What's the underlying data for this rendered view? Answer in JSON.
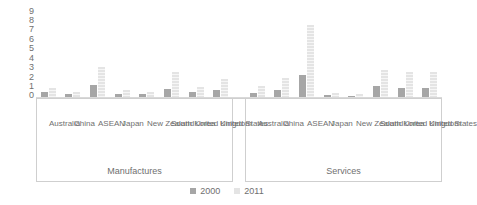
{
  "chart_data": {
    "type": "bar",
    "title": "",
    "xlabel": "",
    "ylabel": "",
    "ylim": [
      0,
      9
    ],
    "yticks": [
      9,
      8,
      7,
      6,
      5,
      4,
      3,
      2,
      1,
      0
    ],
    "grid": false,
    "legend_position": "bottom",
    "categories": [
      "Australia",
      "China",
      "ASEAN",
      "Japan",
      "New Zealand",
      "South Korea",
      "United Kingdom",
      "United States"
    ],
    "groups": [
      "Manufactures",
      "Services"
    ],
    "series": [
      {
        "name": "2000",
        "color": "#a6a6a6",
        "Manufactures": [
          0.55,
          0.3,
          1.3,
          0.35,
          0.3,
          0.8,
          0.55,
          0.75
        ],
        "Services": [
          0.45,
          0.7,
          2.3,
          0.2,
          0.15,
          1.2,
          1.0,
          1.0
        ]
      },
      {
        "name": "2011",
        "color": "#e4e4e4",
        "Manufactures": [
          0.95,
          0.5,
          3.2,
          0.75,
          0.55,
          2.6,
          1.05,
          1.9
        ],
        "Series_note": "",
        "Services": [
          1.2,
          2.0,
          7.6,
          0.45,
          0.35,
          2.9,
          2.7,
          2.6
        ]
      }
    ]
  },
  "axis": {
    "y_ticks": [
      "9",
      "8",
      "7",
      "6",
      "5",
      "4",
      "3",
      "2",
      "1",
      "0"
    ]
  },
  "categories_left": [
    "Australia",
    "China",
    "ASEAN",
    "Japan",
    "New Zealand",
    "South Korea",
    "United Kingdom",
    "United States"
  ],
  "categories_right": [
    "Australia",
    "China",
    "ASEAN",
    "Japan",
    "New Zealand",
    "South Korea",
    "United Kingdom",
    "United States"
  ],
  "group_labels": {
    "left": "Manufactures",
    "right": "Services"
  },
  "legend": {
    "items": [
      {
        "label": "2000",
        "color": "#a6a6a6"
      },
      {
        "label": "2011",
        "color": "#e4e4e4"
      }
    ]
  }
}
